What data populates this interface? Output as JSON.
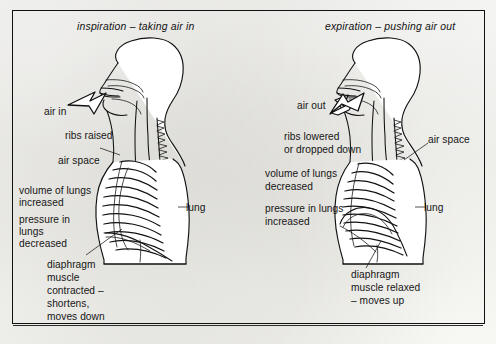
{
  "figure": {
    "kind": "breathing-mechanics-diagram",
    "frame": {
      "border_color": "#111111",
      "background": "#fdfdfb"
    }
  },
  "panels": [
    {
      "id": "inspiration",
      "heading": "inspiration – taking air in",
      "airflow": {
        "label": "air in",
        "direction": "into-mouth",
        "arrow_name": "air-in-arrow"
      },
      "labels": {
        "ribs": "ribs raised",
        "air_space": "air space",
        "lung": "lung",
        "volume_line1": "volume of lungs",
        "volume_line2": "increased",
        "pressure_line1": "pressure in",
        "pressure_line2": "lungs",
        "pressure_line3": "decreased",
        "diaphragm_line1": "diaphragm",
        "diaphragm_line2": "muscle",
        "diaphragm_line3": "contracted –",
        "diaphragm_line4": "shortens,",
        "diaphragm_line5": "moves down"
      }
    },
    {
      "id": "expiration",
      "heading": "expiration – pushing air out",
      "airflow": {
        "label": "air out",
        "direction": "out-of-mouth",
        "arrow_name": "air-out-arrow"
      },
      "labels": {
        "ribs_line1": "ribs lowered",
        "ribs_line2": "or dropped down",
        "air_space": "air space",
        "lung": "lung",
        "volume_line1": "volume of lungs",
        "volume_line2": "decreased",
        "pressure_line1": "pressure in lungs",
        "pressure_line2": "increased",
        "diaphragm_line1": "diaphragm",
        "diaphragm_line2": "muscle relaxed",
        "diaphragm_line3": "– moves up"
      }
    }
  ]
}
